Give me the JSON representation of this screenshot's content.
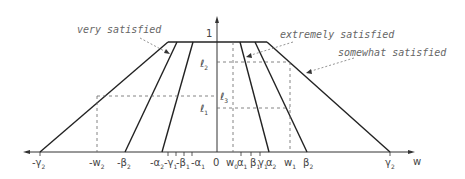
{
  "diagram": {
    "y_axis_label": "1",
    "x_axis_label": "w",
    "annotations": [
      {
        "text": "very satisfied"
      },
      {
        "text": "extremely satisfied"
      },
      {
        "text": "somewhat satisfied"
      }
    ],
    "level_labels": [
      {
        "text": "ℓ",
        "sub": "2"
      },
      {
        "text": "ℓ",
        "sub": "3"
      },
      {
        "text": "ℓ",
        "sub": "1"
      }
    ],
    "x_ticks": [
      {
        "text": "-γ",
        "sub": "2"
      },
      {
        "text": "-w",
        "sub": "2"
      },
      {
        "text": "-β",
        "sub": "2"
      },
      {
        "text": "-α",
        "sub": "2"
      },
      {
        "text": "-γ",
        "sub": "1"
      },
      {
        "text": "-β",
        "sub": "1"
      },
      {
        "text": "-α",
        "sub": "1"
      },
      {
        "text": "0",
        "sub": ""
      },
      {
        "text": "w",
        "sub": "0"
      },
      {
        "text": "α",
        "sub": "1"
      },
      {
        "text": "β",
        "sub": "1"
      },
      {
        "text": "γ",
        "sub": "1"
      },
      {
        "text": "α",
        "sub": "2"
      },
      {
        "text": "w",
        "sub": "1"
      },
      {
        "text": "β",
        "sub": "2"
      },
      {
        "text": "γ",
        "sub": "2"
      }
    ]
  }
}
